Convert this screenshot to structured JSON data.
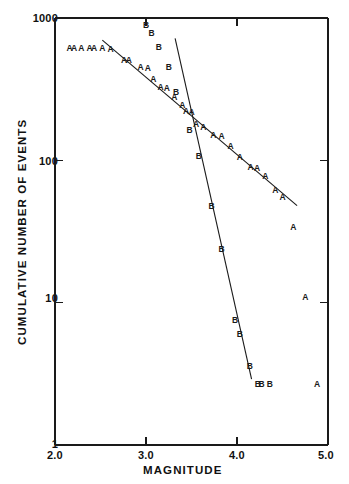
{
  "chart_data": {
    "type": "scatter",
    "title": "",
    "xlabel": "MAGNITUDE",
    "ylabel": "CUMULATIVE NUMBER OF EVENTS",
    "xscale": "linear",
    "yscale": "log",
    "xlim": [
      2.0,
      5.0
    ],
    "ylim": [
      1,
      1000
    ],
    "grid": false,
    "legend_position": "none",
    "xticks": [
      "2.0",
      "3.0",
      "4.0",
      "5.0"
    ],
    "xtick_values": [
      2.0,
      3.0,
      4.0,
      5.0
    ],
    "yticks": [
      "1",
      "10",
      "100",
      "1000"
    ],
    "ytick_values": [
      1,
      10,
      100,
      1000
    ],
    "marker_labels": [
      "A",
      "B"
    ],
    "series": [
      {
        "name": "A",
        "marker": "A",
        "points": [
          {
            "x": 2.16,
            "y": 620
          },
          {
            "x": 2.21,
            "y": 620
          },
          {
            "x": 2.29,
            "y": 620
          },
          {
            "x": 2.38,
            "y": 620
          },
          {
            "x": 2.43,
            "y": 620
          },
          {
            "x": 2.52,
            "y": 615
          },
          {
            "x": 2.61,
            "y": 610
          },
          {
            "x": 2.76,
            "y": 510
          },
          {
            "x": 2.81,
            "y": 505
          },
          {
            "x": 2.94,
            "y": 450
          },
          {
            "x": 3.02,
            "y": 445
          },
          {
            "x": 3.08,
            "y": 375
          },
          {
            "x": 3.16,
            "y": 330
          },
          {
            "x": 3.23,
            "y": 320
          },
          {
            "x": 3.31,
            "y": 280
          },
          {
            "x": 3.4,
            "y": 245
          },
          {
            "x": 3.44,
            "y": 222
          },
          {
            "x": 3.5,
            "y": 218
          },
          {
            "x": 3.55,
            "y": 180
          },
          {
            "x": 3.63,
            "y": 172
          },
          {
            "x": 3.74,
            "y": 150
          },
          {
            "x": 3.83,
            "y": 148
          },
          {
            "x": 3.93,
            "y": 126
          },
          {
            "x": 4.03,
            "y": 105
          },
          {
            "x": 4.15,
            "y": 90
          },
          {
            "x": 4.22,
            "y": 89
          },
          {
            "x": 4.31,
            "y": 78
          },
          {
            "x": 4.42,
            "y": 62
          },
          {
            "x": 4.5,
            "y": 55
          },
          {
            "x": 4.62,
            "y": 34
          },
          {
            "x": 4.75,
            "y": 11
          },
          {
            "x": 4.88,
            "y": 2.7
          }
        ]
      },
      {
        "name": "B",
        "marker": "B",
        "points": [
          {
            "x": 3.0,
            "y": 900
          },
          {
            "x": 3.06,
            "y": 790
          },
          {
            "x": 3.14,
            "y": 630
          },
          {
            "x": 3.25,
            "y": 455
          },
          {
            "x": 3.33,
            "y": 300
          },
          {
            "x": 3.48,
            "y": 163
          },
          {
            "x": 3.58,
            "y": 108
          },
          {
            "x": 3.72,
            "y": 48
          },
          {
            "x": 3.83,
            "y": 24
          },
          {
            "x": 3.98,
            "y": 7.5
          },
          {
            "x": 4.03,
            "y": 6.0
          },
          {
            "x": 4.14,
            "y": 3.6
          },
          {
            "x": 4.23,
            "y": 2.7
          },
          {
            "x": 4.27,
            "y": 2.7
          },
          {
            "x": 4.36,
            "y": 2.7
          }
        ]
      }
    ],
    "fit_lines": [
      {
        "name": "A-fit",
        "series": "A",
        "x1": 2.52,
        "y1": 700,
        "x2": 4.66,
        "y2": 48
      },
      {
        "name": "B-fit",
        "series": "B",
        "x1": 3.32,
        "y1": 720,
        "x2": 4.16,
        "y2": 2.9
      }
    ]
  },
  "axis": {
    "ylabel": "CUMULATIVE NUMBER OF EVENTS",
    "xlabel": "MAGNITUDE",
    "ytop": "1000",
    "ymid_hi": "100",
    "ymid_lo": "10",
    "ybottom": "1",
    "x0": "2.0",
    "x1": "3.0",
    "x2": "4.0",
    "x3": "5.0"
  },
  "colors": {
    "ink": "#1a1a1a",
    "background": "#ffffff"
  }
}
